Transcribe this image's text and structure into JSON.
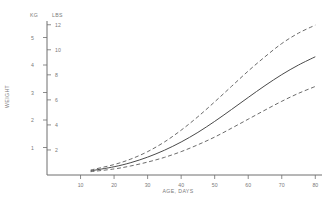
{
  "chart_data": {
    "type": "line",
    "title": "",
    "xlabel": "AGE, DAYS",
    "ylabel": "WEIGHT",
    "xlim": [
      0,
      82
    ],
    "ylim_kg": [
      0,
      5.6
    ],
    "ylim_lbs": [
      0,
      12.3
    ],
    "grid": false,
    "legend": "none",
    "axes": {
      "left_unit": "KG",
      "right_unit": "LBS",
      "kg_ticks": [
        1,
        2,
        3,
        4,
        5
      ],
      "lbs_ticks": [
        2,
        4,
        6,
        8,
        10,
        12
      ],
      "x_ticks": [
        10,
        20,
        30,
        40,
        50,
        60,
        70,
        80
      ]
    },
    "x": [
      13,
      20,
      25,
      30,
      35,
      40,
      45,
      50,
      55,
      60,
      65,
      70,
      75,
      80
    ],
    "series": [
      {
        "name": "upper",
        "style": "dashed",
        "values_kg": [
          0.18,
          0.38,
          0.58,
          0.85,
          1.2,
          1.63,
          2.12,
          2.66,
          3.22,
          3.78,
          4.3,
          4.78,
          5.16,
          5.45
        ]
      },
      {
        "name": "median",
        "style": "solid",
        "values_kg": [
          0.15,
          0.3,
          0.45,
          0.65,
          0.9,
          1.2,
          1.55,
          1.95,
          2.38,
          2.82,
          3.25,
          3.65,
          4.0,
          4.3
        ]
      },
      {
        "name": "lower",
        "style": "dashed",
        "values_kg": [
          0.12,
          0.22,
          0.33,
          0.47,
          0.64,
          0.85,
          1.1,
          1.38,
          1.7,
          2.03,
          2.36,
          2.68,
          2.97,
          3.22
        ]
      }
    ]
  }
}
